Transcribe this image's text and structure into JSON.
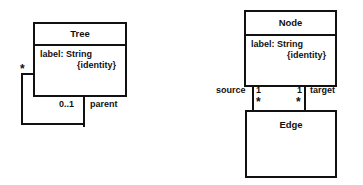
{
  "diagram": {
    "stroke_color": "#111111",
    "background_color": "#ffffff"
  },
  "left_diagram": {
    "class_tree": {
      "name": "Tree",
      "attributes": [
        "label: String",
        "{identity}"
      ]
    },
    "association": {
      "source_multiplicity": "*",
      "target_multiplicity": "0..1",
      "role_name": "parent"
    }
  },
  "right_diagram": {
    "class_node": {
      "name": "Node",
      "attributes": [
        "label: String",
        "{identity}"
      ]
    },
    "class_edge": {
      "name": "Edge",
      "attributes": []
    },
    "association_source": {
      "role_name": "source",
      "node_end_multiplicity": "1",
      "edge_end_multiplicity": "*"
    },
    "association_target": {
      "role_name": "target",
      "node_end_multiplicity": "1",
      "edge_end_multiplicity": "*"
    }
  }
}
